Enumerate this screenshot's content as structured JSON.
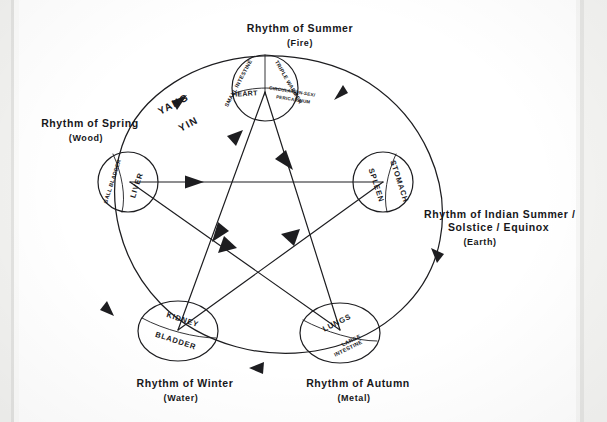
{
  "document": {
    "kind": "hand-drawn-diagram",
    "title_visible": false,
    "ink_color": "#1d1d20",
    "paper_color": "#ffffff"
  },
  "diagram": {
    "name": "five-element-rhythm-wheel",
    "outer_cycle_direction": "counterclockwise",
    "inner_cycle": "pentagram",
    "polarity_labels": {
      "yang": "YANG",
      "yin": "YIN"
    },
    "seasons": [
      {
        "id": "fire",
        "position": "top",
        "caption_line1": "Rhythm of Summer",
        "caption_line2": "(Fire)",
        "organs": [
          {
            "name": "SMALL INTESTINE",
            "quadrant": "upper-left"
          },
          {
            "name": "TRIPLE WARMER",
            "quadrant": "upper-right"
          },
          {
            "name": "HEART",
            "quadrant": "lower-left"
          },
          {
            "name": "CIRCULATION-SEX/",
            "quadrant": "lower-right"
          },
          {
            "name": "PERICARDIUM",
            "quadrant": "lower-right-2"
          }
        ]
      },
      {
        "id": "wood",
        "position": "left",
        "caption_line1": "Rhythm of Spring",
        "caption_line2": "(Wood)",
        "organs": [
          {
            "name": "GALL BLADDER",
            "quadrant": "outer"
          },
          {
            "name": "LIVER",
            "quadrant": "inner"
          }
        ]
      },
      {
        "id": "earth",
        "position": "right",
        "caption_line1": "Rhythm of Indian Summer /",
        "caption_line2": "Solstice / Equinox",
        "caption_line3": "(Earth)",
        "organs": [
          {
            "name": "SPLEEN",
            "quadrant": "inner"
          },
          {
            "name": "STOMACH",
            "quadrant": "outer"
          }
        ]
      },
      {
        "id": "water",
        "position": "bottom-left",
        "caption_line1": "Rhythm of Winter",
        "caption_line2": "(Water)",
        "organs": [
          {
            "name": "KIDNEY",
            "quadrant": "upper"
          },
          {
            "name": "BLADDER",
            "quadrant": "lower"
          }
        ]
      },
      {
        "id": "metal",
        "position": "bottom-right",
        "caption_line1": "Rhythm of Autumn",
        "caption_line2": "(Metal)",
        "organs": [
          {
            "name": "LUNGS",
            "quadrant": "upper"
          },
          {
            "name": "LARGE",
            "quadrant": "lower"
          },
          {
            "name": "INTESTINE",
            "quadrant": "lower-2"
          }
        ]
      }
    ]
  }
}
